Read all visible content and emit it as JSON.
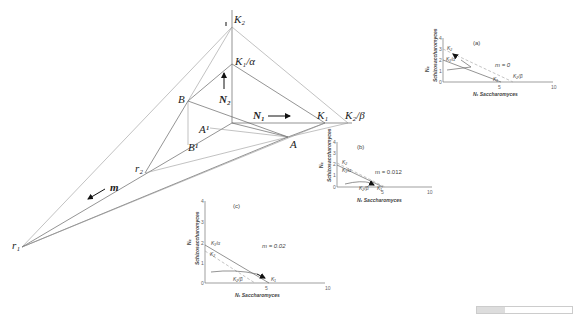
{
  "main_diagram": {
    "labels": {
      "K2": "K₂",
      "K1_alpha": "K₁/α",
      "B": "B",
      "N2": "N₂",
      "N1": "N₁",
      "K1": "K₁",
      "K2_beta": "K₂/β",
      "A1": "A¹",
      "A": "A",
      "B1": "B¹",
      "r2": "r₂",
      "m": "m",
      "r1": "r₁"
    }
  },
  "insets": [
    {
      "panel": "(a)",
      "m_label": "m = 0",
      "xlabel": "N₁ Saccharomyces",
      "ylabel_sym": "N₂",
      "ylabel": "Schizosaccharomyces",
      "xticks": [
        "0",
        "5",
        "10"
      ],
      "yticks": [
        "0",
        "1",
        "2",
        "3",
        "4"
      ],
      "curve_labels": [
        "K₂",
        "K₁/α",
        "K₁",
        "K₂/β"
      ]
    },
    {
      "panel": "(b)",
      "m_label": "m = 0.012",
      "xlabel": "N₁ Saccharomyces",
      "ylabel_sym": "N₂",
      "ylabel": "Schizosaccharomyces",
      "xticks": [
        "0",
        "5",
        "10"
      ],
      "yticks": [
        "0",
        "1",
        "2",
        "3",
        "4"
      ],
      "curve_labels": [
        "K₂",
        "K₁/α",
        "K₂/β",
        "K₁"
      ]
    },
    {
      "panel": "(c)",
      "m_label": "m = 0.02",
      "xlabel": "N₁ Saccharomyces",
      "ylabel_sym": "N₂",
      "ylabel": "Schizosaccharomyces",
      "xticks": [
        "0",
        "5",
        "10"
      ],
      "yticks": [
        "0",
        "1",
        "2",
        "3",
        "4"
      ],
      "curve_labels": [
        "K₁/α",
        "K₂",
        "K₂/β",
        "K₁"
      ]
    }
  ]
}
